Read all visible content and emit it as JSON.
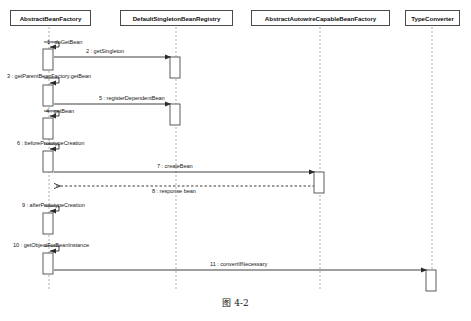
{
  "diagram": {
    "type": "uml-sequence-diagram",
    "caption": "图 4-2",
    "participants": [
      {
        "id": "abf",
        "name": "AbstractBeanFactory",
        "box_x": 10,
        "box_w": 81,
        "lifeline_x": 49
      },
      {
        "id": "dsbr",
        "name": "DefaultSingletonBeanRegistry",
        "box_x": 120,
        "box_w": 113,
        "lifeline_x": 176
      },
      {
        "id": "aacbf",
        "name": "AbstractAutowireCapableBeanFactory",
        "box_x": 251,
        "box_w": 139,
        "lifeline_x": 320
      },
      {
        "id": "tc",
        "name": "TypeConverter",
        "box_x": 405,
        "box_w": 55,
        "lifeline_x": 432
      }
    ],
    "messages": [
      {
        "seq": "1",
        "label": "1 : doGetBean",
        "from": "abf",
        "to": "abf",
        "kind": "self",
        "y": 48,
        "label_x": 47,
        "label_y": 39
      },
      {
        "seq": "2",
        "label": "2 : getSingleton",
        "from": "abf",
        "to": "dsbr",
        "kind": "call",
        "y": 57,
        "label_x": 86,
        "label_y": 48
      },
      {
        "seq": "3",
        "label": "3 : getParentBeanFactory.getBean",
        "from": "abf",
        "to": "abf",
        "kind": "self",
        "y": 84,
        "label_x": 7,
        "label_y": 73
      },
      {
        "seq": "4",
        "label": "4 : getBean",
        "from": "abf",
        "to": "abf",
        "kind": "self",
        "y": 117,
        "label_x": 46,
        "label_y": 108
      },
      {
        "seq": "5",
        "label": "5 : registerDependentBean",
        "from": "abf",
        "to": "dsbr",
        "kind": "call",
        "y": 104,
        "label_x": 99,
        "label_y": 95
      },
      {
        "seq": "6",
        "label": "6 : beforePrototypeCreation",
        "from": "abf",
        "to": "abf",
        "kind": "self",
        "y": 150,
        "label_x": 17,
        "label_y": 140
      },
      {
        "seq": "7",
        "label": "7 : createBean",
        "from": "abf",
        "to": "aacbf",
        "kind": "call",
        "y": 172,
        "label_x": 157,
        "label_y": 163
      },
      {
        "seq": "8",
        "label": "8 : response bean",
        "from": "aacbf",
        "to": "abf",
        "kind": "return",
        "y": 186,
        "label_x": 152,
        "label_y": 188
      },
      {
        "seq": "9",
        "label": "9 : afterPrototypeCreation",
        "from": "abf",
        "to": "abf",
        "kind": "self",
        "y": 212,
        "label_x": 22,
        "label_y": 202
      },
      {
        "seq": "10",
        "label": "10 : getObjectForBeanInstance",
        "from": "abf",
        "to": "abf",
        "kind": "self",
        "y": 252,
        "label_x": 13,
        "label_y": 242
      },
      {
        "seq": "11",
        "label": "11 : convertIfNecessary",
        "from": "abf",
        "to": "tc",
        "kind": "call",
        "y": 270,
        "label_x": 210,
        "label_y": 261
      }
    ],
    "activations": [
      {
        "on": "abf",
        "x": 43,
        "y": 49,
        "w": 10,
        "h": 21
      },
      {
        "on": "dsbr",
        "x": 170,
        "y": 57,
        "w": 10,
        "h": 21
      },
      {
        "on": "abf",
        "x": 43,
        "y": 85,
        "w": 10,
        "h": 21
      },
      {
        "on": "dsbr",
        "x": 170,
        "y": 104,
        "w": 10,
        "h": 21
      },
      {
        "on": "abf",
        "x": 43,
        "y": 118,
        "w": 10,
        "h": 21
      },
      {
        "on": "abf",
        "x": 43,
        "y": 151,
        "w": 10,
        "h": 21
      },
      {
        "on": "aacbf",
        "x": 314,
        "y": 172,
        "w": 10,
        "h": 21
      },
      {
        "on": "abf",
        "x": 43,
        "y": 213,
        "w": 10,
        "h": 21
      },
      {
        "on": "abf",
        "x": 43,
        "y": 253,
        "w": 10,
        "h": 21
      },
      {
        "on": "tc",
        "x": 426,
        "y": 270,
        "w": 10,
        "h": 21
      }
    ],
    "colors": {
      "line": "#4a4a4a",
      "lifeline": "#9a9a9a",
      "text": "#111111",
      "background": "#ffffff"
    },
    "lifeline_top": 27,
    "lifeline_bottom": 290
  }
}
